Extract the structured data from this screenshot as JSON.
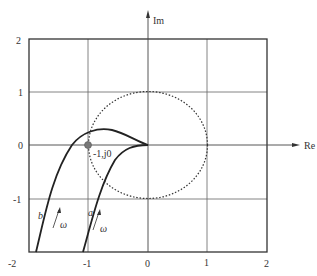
{
  "diagram": {
    "type": "nyquist-plot",
    "axes": {
      "x_label": "Re",
      "y_label": "Im",
      "x_ticks": [
        "-2",
        "-1",
        "0",
        "1",
        "2"
      ],
      "y_ticks": [
        "2",
        "1",
        "0",
        "-1"
      ],
      "xlim": [
        -2,
        2
      ],
      "ylim": [
        -2,
        2
      ]
    },
    "critical_point": {
      "label": "-1,j0",
      "x": -1,
      "y": 0
    },
    "unit_circle": {
      "style": "dotted",
      "radius": 1
    },
    "curves": [
      {
        "name": "a",
        "direction_label": "ω"
      },
      {
        "name": "b",
        "direction_label": "ω"
      }
    ],
    "colors": {
      "curve": "#222222",
      "grid": "#555555",
      "background": "#ffffff"
    }
  }
}
